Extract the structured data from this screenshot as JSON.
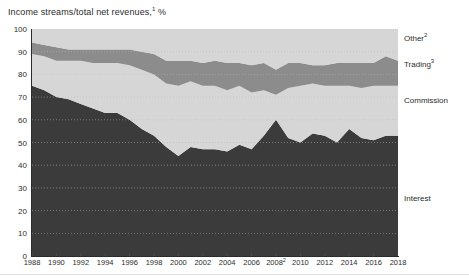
{
  "chart_data": {
    "type": "area",
    "title_text": "Income streams/total net revenues,",
    "title_sup": "1",
    "title_unit": "%",
    "xlabel": "",
    "ylabel": "",
    "stacked": true,
    "grid": true,
    "legend_position": "right",
    "ylim": [
      0,
      100
    ],
    "yticks": [
      0,
      10,
      20,
      30,
      40,
      50,
      60,
      70,
      80,
      90,
      100
    ],
    "ytick_labels": [
      "0",
      "10",
      "20",
      "30",
      "40",
      "50",
      "60",
      "70",
      "80",
      "90",
      "100"
    ],
    "xlim": [
      1988,
      2018
    ],
    "xticks": [
      1988,
      1990,
      1992,
      1994,
      1996,
      1998,
      2000,
      2002,
      2004,
      2006,
      2008,
      2010,
      2012,
      2014,
      2016,
      2018
    ],
    "xtick_labels": [
      {
        "text": "1988",
        "sup": ""
      },
      {
        "text": "1990",
        "sup": ""
      },
      {
        "text": "1992",
        "sup": ""
      },
      {
        "text": "1994",
        "sup": ""
      },
      {
        "text": "1996",
        "sup": ""
      },
      {
        "text": "1998",
        "sup": ""
      },
      {
        "text": "2000",
        "sup": ""
      },
      {
        "text": "2002",
        "sup": ""
      },
      {
        "text": "2004",
        "sup": ""
      },
      {
        "text": "2006",
        "sup": ""
      },
      {
        "text": "2008",
        "sup": "2"
      },
      {
        "text": "2010",
        "sup": ""
      },
      {
        "text": "2012",
        "sup": ""
      },
      {
        "text": "2014",
        "sup": ""
      },
      {
        "text": "2016",
        "sup": ""
      },
      {
        "text": "2018",
        "sup": ""
      }
    ],
    "x": [
      1988,
      1989,
      1990,
      1991,
      1992,
      1993,
      1994,
      1995,
      1996,
      1997,
      1998,
      1999,
      2000,
      2001,
      2002,
      2003,
      2004,
      2005,
      2006,
      2007,
      2008,
      2009,
      2010,
      2011,
      2012,
      2013,
      2014,
      2015,
      2016,
      2017,
      2018
    ],
    "series": [
      {
        "name": "Interest",
        "color": "#3b3b3b",
        "values": [
          75,
          73,
          70,
          69,
          67,
          65,
          63,
          63,
          60,
          56,
          53,
          48,
          44,
          48,
          47,
          47,
          46,
          49,
          47,
          53,
          60,
          52,
          50,
          54,
          53,
          50,
          56,
          52,
          51,
          53,
          53
        ]
      },
      {
        "name": "Commission",
        "color": "#d6d6d6",
        "values": [
          14,
          15,
          16,
          17,
          19,
          20,
          22,
          22,
          24,
          26,
          27,
          28,
          31,
          29,
          28,
          28,
          27,
          26,
          25,
          20,
          11,
          22,
          25,
          22,
          22,
          25,
          19,
          22,
          24,
          22,
          22
        ]
      },
      {
        "name": "Trading",
        "color": "#8c8c8c",
        "values": [
          5,
          5,
          6,
          5,
          5,
          6,
          6,
          6,
          7,
          8,
          9,
          10,
          11,
          9,
          10,
          11,
          12,
          10,
          12,
          12,
          11,
          11,
          10,
          8,
          9,
          10,
          10,
          11,
          10,
          13,
          11
        ]
      },
      {
        "name": "Other",
        "color": "#d6d6d6",
        "values": [
          6,
          7,
          8,
          9,
          9,
          9,
          9,
          9,
          9,
          10,
          11,
          14,
          14,
          14,
          15,
          14,
          15,
          15,
          16,
          15,
          18,
          15,
          15,
          16,
          16,
          15,
          15,
          15,
          15,
          12,
          14
        ]
      }
    ],
    "legend": [
      {
        "label": "Other",
        "sup": "2",
        "color": "#d6d6d6",
        "y_px": 34
      },
      {
        "label": "Trading",
        "sup": "3",
        "color": "#8c8c8c",
        "y_px": 60
      },
      {
        "label": "Commission",
        "sup": "",
        "color": "#d6d6d6",
        "y_px": 96
      },
      {
        "label": "Interest",
        "sup": "",
        "color": "#3b3b3b",
        "y_px": 194
      }
    ],
    "colors": {
      "interest": "#3b3b3b",
      "commission": "#d6d6d6",
      "trading": "#8c8c8c",
      "other": "#d6d6d6",
      "axis": "#2b2b2b",
      "grid": "#b8b8b8",
      "background": "#ffffff",
      "text": "#2b2b2b"
    }
  }
}
